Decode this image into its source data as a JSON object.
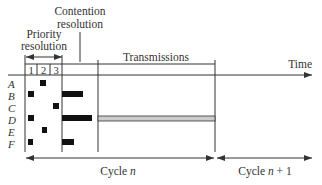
{
  "labels": {
    "contention_line1": "Contention",
    "contention_line2": "resolution",
    "priority_line1": "Priority",
    "priority_line2": "resolution",
    "transmissions": "Transmissions",
    "time": "Time",
    "cycle_n_prefix": "Cycle ",
    "cycle_n_var": "n",
    "cycle_n1_prefix": "Cycle ",
    "cycle_n1_var": "n",
    "cycle_n1_suffix": " + 1"
  },
  "priority_slots": [
    "1",
    "2",
    "3"
  ],
  "stations": [
    {
      "name": "A",
      "priority_slot": 2,
      "contention_len": 0,
      "transmits": false
    },
    {
      "name": "B",
      "priority_slot": 1,
      "contention_len": 21,
      "transmits": false
    },
    {
      "name": "C",
      "priority_slot": 3,
      "contention_len": 0,
      "transmits": false
    },
    {
      "name": "D",
      "priority_slot": 1,
      "contention_len": 30,
      "transmits": true
    },
    {
      "name": "E",
      "priority_slot": 2,
      "contention_len": 0,
      "transmits": false
    },
    {
      "name": "F",
      "priority_slot": 1,
      "contention_len": 12,
      "transmits": false
    }
  ],
  "colors": {
    "line": "#333333",
    "block": "#111111",
    "transmission_fill": "#cccccc"
  }
}
